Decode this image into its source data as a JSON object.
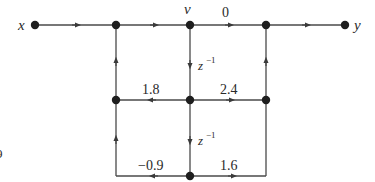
{
  "diagram": {
    "type": "signal-flow-graph",
    "colors": {
      "line": "#4a4a4a",
      "node": "#1e1e1e",
      "text": "#2a2a2a"
    },
    "labels": {
      "input": "x",
      "output": "y",
      "state": "v",
      "gain_top": "0",
      "delay_upper": "z",
      "delay_upper_exp": "−1",
      "delay_lower": "z",
      "delay_lower_exp": "−1",
      "gain_mid_left": "1.8",
      "gain_mid_right": "2.4",
      "gain_bottom_left": "−0.9",
      "gain_bottom_right": "1.6",
      "edge_fragment": "9"
    },
    "nodes": [
      {
        "id": "x",
        "x": 35,
        "y": 25
      },
      {
        "id": "n1",
        "x": 116,
        "y": 25
      },
      {
        "id": "v",
        "x": 190,
        "y": 25
      },
      {
        "id": "n3",
        "x": 266,
        "y": 25
      },
      {
        "id": "y",
        "x": 345,
        "y": 25
      },
      {
        "id": "m1",
        "x": 116,
        "y": 100
      },
      {
        "id": "m2",
        "x": 190,
        "y": 100
      },
      {
        "id": "m3",
        "x": 266,
        "y": 100
      },
      {
        "id": "b2",
        "x": 190,
        "y": 176
      }
    ]
  }
}
